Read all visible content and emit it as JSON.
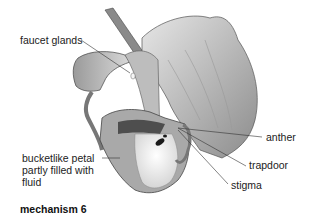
{
  "diagram": {
    "caption": "mechanism 6",
    "labels": {
      "faucet_glands": "faucet glands",
      "bucket_line1": "bucketlike petal",
      "bucket_line2": "partly filled with",
      "bucket_line3": "fluid",
      "anther": "anther",
      "trapdoor": "trapdoor",
      "stigma": "stigma"
    },
    "colors": {
      "petal_light": "#d9d9d9",
      "petal_mid": "#a8a8a8",
      "petal_dark": "#5a5a5a",
      "fluid": "#f2f2f2",
      "leader_line": "#333333"
    }
  }
}
